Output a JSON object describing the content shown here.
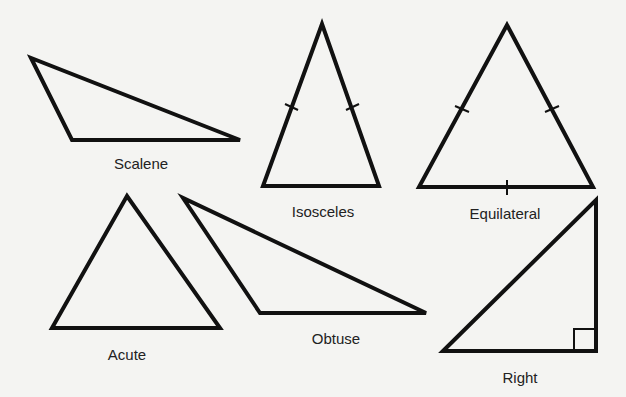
{
  "diagram": {
    "stroke_color": "#111111",
    "background": "#f4f4f2",
    "triangles": [
      {
        "id": "scalene",
        "label": "Scalene",
        "points": "31,58 72,140 240,140",
        "label_pos": [
          141,
          155
        ]
      },
      {
        "id": "isosceles",
        "label": "Isosceles",
        "points": "322,24 263,186 379,186",
        "label_pos": [
          323,
          203
        ]
      },
      {
        "id": "equilateral",
        "label": "Equilateral",
        "points": "507,25 419,187 593,187",
        "label_pos": [
          505,
          205
        ]
      },
      {
        "id": "acute",
        "label": "Acute",
        "points": "127,196 52,328 220,328",
        "label_pos": [
          127,
          346
        ]
      },
      {
        "id": "obtuse",
        "label": "Obtuse",
        "points": "183,198 260,313 426,313",
        "label_pos": [
          336,
          330
        ]
      },
      {
        "id": "right",
        "label": "Right",
        "points": "443,351 596,200 596,351",
        "label_pos": [
          520,
          369
        ]
      }
    ]
  }
}
